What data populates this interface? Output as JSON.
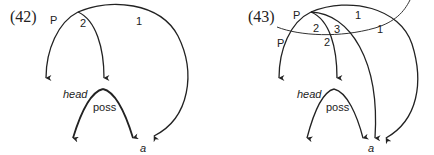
{
  "figures": [
    {
      "number": "(42)",
      "labels": {
        "p": "P",
        "two": "2",
        "one": "1",
        "head": "head",
        "poss": "poss",
        "a": "a"
      }
    },
    {
      "number": "(43)",
      "labels": {
        "p_top": "P",
        "p_left": "P",
        "two_top": "2",
        "three": "3",
        "two_bottom": "2",
        "one_top": "1",
        "one_right": "1",
        "head": "head",
        "poss": "poss",
        "a": "a"
      }
    }
  ],
  "colors": {
    "stroke": "#222222",
    "background": "#ffffff"
  }
}
